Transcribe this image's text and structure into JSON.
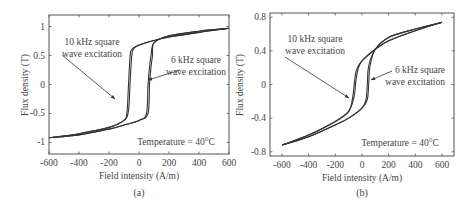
{
  "chart_data": [
    {
      "type": "line",
      "panel_label": "(a)",
      "title": "",
      "xlabel": "Field intensity (A/m)",
      "ylabel": "Flux density (T)",
      "xlim": [
        -600,
        600
      ],
      "ylim": [
        -1.2,
        1.2
      ],
      "xticks": [
        -600,
        -400,
        -200,
        0,
        200,
        400,
        600
      ],
      "yticks": [
        -1,
        -0.5,
        0,
        0.5,
        1
      ],
      "ytick_labels": [
        "-1",
        "-0.5",
        "0",
        "0.5",
        "1"
      ],
      "grid": false,
      "annotations": [
        {
          "text_lines": [
            "10 kHz square",
            "wave excitation"
          ],
          "points_to": [
            -60,
            -0.25
          ]
        },
        {
          "text_lines": [
            "6 kHz square",
            "wave excitation"
          ],
          "points_to": [
            60,
            0.1
          ]
        },
        {
          "text": "Temperature = 40°C"
        }
      ],
      "series": [
        {
          "name": "10 kHz square wave excitation",
          "description": "hysteresis loop, coercivity ~±60 A/m",
          "ascending_branch": {
            "H": [
              -600,
              -400,
              -200,
              -100,
              -70,
              -60,
              -50,
              -40,
              0,
              100,
              200,
              400,
              600
            ],
            "B": [
              -0.92,
              -0.85,
              -0.74,
              -0.62,
              -0.45,
              0.0,
              0.45,
              0.6,
              0.68,
              0.76,
              0.82,
              0.9,
              0.97
            ]
          },
          "descending_branch": {
            "H": [
              600,
              400,
              200,
              100,
              80,
              70,
              60,
              50,
              0,
              -100,
              -200,
              -400,
              -600
            ],
            "B": [
              0.97,
              0.92,
              0.84,
              0.72,
              0.5,
              0.3,
              0.0,
              -0.5,
              -0.62,
              -0.7,
              -0.77,
              -0.87,
              -0.92
            ]
          }
        },
        {
          "name": "6 kHz square wave excitation",
          "description": "hysteresis loop, slightly wider",
          "ascending_branch": {
            "H": [
              -600,
              -400,
              -200,
              -100,
              -80,
              -70,
              -60,
              -50,
              0,
              100,
              200,
              400,
              600
            ],
            "B": [
              -0.92,
              -0.85,
              -0.74,
              -0.62,
              -0.47,
              0.0,
              0.47,
              0.6,
              0.68,
              0.76,
              0.82,
              0.9,
              0.97
            ]
          },
          "descending_branch": {
            "H": [
              600,
              400,
              200,
              100,
              90,
              80,
              70,
              60,
              0,
              -100,
              -200,
              -400,
              -600
            ],
            "B": [
              0.97,
              0.92,
              0.84,
              0.72,
              0.5,
              0.3,
              0.0,
              -0.5,
              -0.62,
              -0.7,
              -0.77,
              -0.87,
              -0.92
            ]
          }
        }
      ]
    },
    {
      "type": "line",
      "panel_label": "(b)",
      "title": "",
      "xlabel": "Field intensity (A/m)",
      "ylabel": "Flux density (T)",
      "xlim": [
        -690,
        690
      ],
      "ylim": [
        -0.85,
        0.85
      ],
      "xticks": [
        -600,
        -400,
        -200,
        0,
        200,
        400,
        600
      ],
      "yticks": [
        -0.8,
        -0.4,
        0,
        0.4,
        0.8
      ],
      "ytick_labels": [
        "-0.8",
        "-0.4",
        "0",
        "0.4",
        "0.8"
      ],
      "grid": false,
      "annotations": [
        {
          "text_lines": [
            "10 kHz square",
            "wave excitation"
          ],
          "points_to": [
            -60,
            -0.15
          ]
        },
        {
          "text_lines": [
            "6 kHz square",
            "wave excitation"
          ],
          "points_to": [
            50,
            0.08
          ]
        },
        {
          "text": "Temperature = 40°C"
        }
      ],
      "series": [
        {
          "name": "10 kHz square wave excitation",
          "description": "narrow S-shaped hysteresis loop",
          "ascending_branch": {
            "H": [
              -600,
              -400,
              -200,
              -100,
              -60,
              -45,
              -30,
              0,
              100,
              200,
              400,
              600
            ],
            "B": [
              -0.72,
              -0.6,
              -0.44,
              -0.32,
              -0.15,
              0.05,
              0.18,
              0.28,
              0.42,
              0.52,
              0.64,
              0.74
            ]
          },
          "descending_branch": {
            "H": [
              600,
              400,
              200,
              100,
              50,
              40,
              30,
              0,
              -100,
              -200,
              -400,
              -600
            ],
            "B": [
              0.74,
              0.66,
              0.56,
              0.42,
              0.22,
              0.0,
              -0.18,
              -0.28,
              -0.4,
              -0.48,
              -0.62,
              -0.72
            ]
          }
        },
        {
          "name": "6 kHz square wave excitation",
          "description": "slightly wider S-shaped loop",
          "ascending_branch": {
            "H": [
              -600,
              -400,
              -200,
              -100,
              -70,
              -55,
              -40,
              0,
              100,
              200,
              400,
              600
            ],
            "B": [
              -0.72,
              -0.6,
              -0.44,
              -0.32,
              -0.15,
              0.05,
              0.18,
              0.28,
              0.42,
              0.52,
              0.64,
              0.74
            ]
          },
          "descending_branch": {
            "H": [
              600,
              400,
              200,
              100,
              60,
              50,
              40,
              0,
              -100,
              -200,
              -400,
              -600
            ],
            "B": [
              0.74,
              0.66,
              0.56,
              0.42,
              0.22,
              0.0,
              -0.18,
              -0.28,
              -0.4,
              -0.48,
              -0.62,
              -0.72
            ]
          }
        }
      ]
    }
  ]
}
